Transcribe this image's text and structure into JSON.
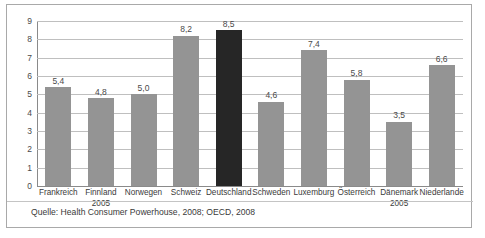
{
  "chart_data": {
    "type": "bar",
    "title": "",
    "xlabel": "",
    "ylabel": "",
    "ylim": [
      0,
      9
    ],
    "yticks": [
      "0",
      "1",
      "2",
      "3",
      "4",
      "5",
      "6",
      "7",
      "8",
      "9"
    ],
    "grid": true,
    "legend": "none",
    "decimal_separator": ",",
    "categories": [
      "Frankreich",
      "Finnland",
      "Norwegen",
      "Schweiz",
      "Deutschland",
      "Schweden",
      "Luxemburg",
      "Österreich",
      "Dänemark",
      "Niederlande"
    ],
    "category_sublabels": [
      "",
      "2005",
      "",
      "",
      "",
      "",
      "",
      "",
      "2005",
      ""
    ],
    "values": [
      5.4,
      4.8,
      5.0,
      8.2,
      8.5,
      4.6,
      7.4,
      5.8,
      3.5,
      6.6
    ],
    "value_labels": [
      "5,4",
      "4,8",
      "5,0",
      "8,2",
      "8,5",
      "4,6",
      "7,4",
      "5,8",
      "3,5",
      "6,6"
    ],
    "highlight_index": 4,
    "colors": {
      "bar": "#949494",
      "bar_highlight": "#262626",
      "gridline": "#bfbfbf",
      "axis": "#8a8a8a",
      "frame": "#a9a9a9",
      "text": "#3a3a3a"
    }
  },
  "source": {
    "note": "Quelle: Health Consumer Powerhouse, 2008; OECD, 2008"
  }
}
